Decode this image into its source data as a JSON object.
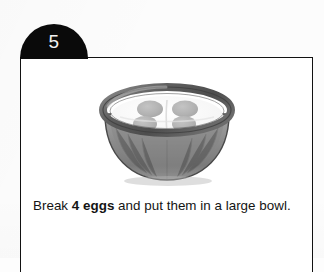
{
  "card": {
    "step_number": "5",
    "caption": {
      "lead_text": "Break ",
      "highlight_text": "4 eggs",
      "trail_text": " and put them in a large bowl."
    },
    "illustration": {
      "name": "mixing-bowl-with-eggs",
      "alt": "A large bowl containing four raw eggs",
      "egg_count": 4,
      "colors": {
        "bowl_rim": "#6f6f6f",
        "bowl_body": "#8d8d8d",
        "bowl_interior": "#c9c9c9",
        "egg_white": "#fbfbfb",
        "egg_yolk": "#b6b6b6",
        "outline": "#4a4a4a"
      }
    },
    "colors": {
      "tab_background": "#0a0a0a",
      "tab_text": "#f2f2f2",
      "card_background": "#ffffff",
      "card_border": "#121212",
      "page_background": "#fcfcfc",
      "caption_text": "#141414"
    }
  }
}
